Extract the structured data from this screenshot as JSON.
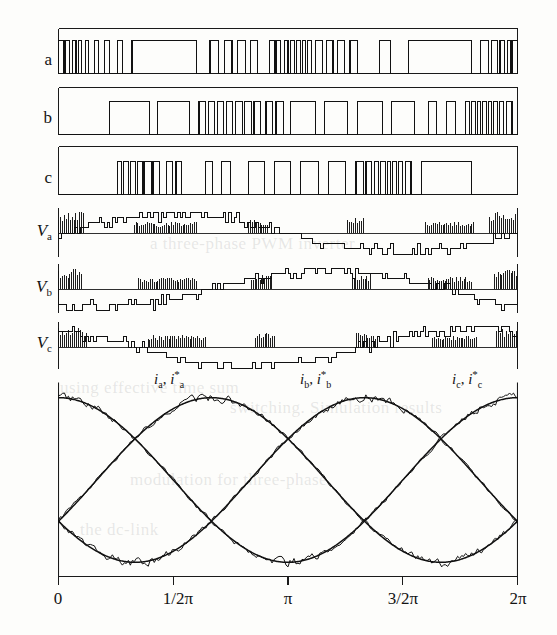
{
  "figure": {
    "background_color": "#fdfdfb",
    "line_color": "#111111",
    "axis_color": "#1a1a1a"
  },
  "axes": {
    "x_ticks": [
      {
        "label": "0",
        "value": 0
      },
      {
        "label": "1/2π",
        "value": 1.5707963
      },
      {
        "label": "π",
        "value": 3.1415927
      },
      {
        "label": "3/2π",
        "value": 4.712389
      },
      {
        "label": "2π",
        "value": 6.2831853
      }
    ],
    "x_range": [
      0,
      6.2831853
    ],
    "y_labels": [
      "a",
      "b",
      "c",
      "Va",
      "Vb",
      "Vc"
    ]
  },
  "row_labels": {
    "a": "a",
    "b": "b",
    "c": "c",
    "va_main": "V",
    "va_sub": "a",
    "vb_main": "V",
    "vb_sub": "b",
    "vc_main": "V",
    "vc_sub": "c"
  },
  "current_labels": [
    {
      "base": "i",
      "sub": "a",
      "star": "*",
      "sep": ", "
    },
    {
      "base": "i",
      "sub": "b",
      "star": "*",
      "sep": ", "
    },
    {
      "base": "i",
      "sub": "c",
      "star": "*",
      "sep": ", "
    }
  ],
  "bleed_text": [
    {
      "text": "a three-phase PWM inverter",
      "x": 150,
      "y": 234
    },
    {
      "text": "using effective time sum",
      "x": 60,
      "y": 378
    },
    {
      "text": "switching. Simulation results",
      "x": 230,
      "y": 398
    },
    {
      "text": "modulation for three-phase",
      "x": 130,
      "y": 470
    },
    {
      "text": "the dc-link",
      "x": 80,
      "y": 520
    }
  ],
  "chart_data": {
    "type": "line",
    "xlabel": "",
    "ylabel": "",
    "xlim": [
      0,
      6.2831853
    ],
    "x_tick_labels": [
      "0",
      "1/2π",
      "π",
      "3/2π",
      "2π"
    ],
    "x_tick_values": [
      0,
      1.5707963,
      3.1415927,
      4.712389,
      6.2831853
    ],
    "grid": false,
    "legend": "none",
    "panels": [
      {
        "name": "a",
        "kind": "switching_function",
        "ylim": [
          0,
          1
        ],
        "description": "Phase-a switching function: binary 0/1 PWM gating signal, one fundamental period",
        "comment": "pulse list: [start,end] normalized 0..1 of the x-span, value 1 (high) between entries",
        "pulses": [
          [
            0.0,
            0.012
          ],
          [
            0.016,
            0.024
          ],
          [
            0.03,
            0.038
          ],
          [
            0.044,
            0.05
          ],
          [
            0.058,
            0.066
          ],
          [
            0.078,
            0.088
          ],
          [
            0.1,
            0.112
          ],
          [
            0.128,
            0.14
          ],
          [
            0.16,
            0.3
          ],
          [
            0.33,
            0.348
          ],
          [
            0.362,
            0.378
          ],
          [
            0.39,
            0.408
          ],
          [
            0.418,
            0.434
          ],
          [
            0.46,
            0.47
          ],
          [
            0.474,
            0.484
          ],
          [
            0.492,
            0.5
          ],
          [
            0.506,
            0.514
          ],
          [
            0.518,
            0.527
          ],
          [
            0.531,
            0.539
          ],
          [
            0.543,
            0.551
          ],
          [
            0.56,
            0.575
          ],
          [
            0.584,
            0.598
          ],
          [
            0.608,
            0.624
          ],
          [
            0.635,
            0.652
          ],
          [
            0.7,
            0.724
          ],
          [
            0.762,
            0.9
          ],
          [
            0.92,
            0.936
          ],
          [
            0.944,
            0.956
          ],
          [
            0.962,
            0.972
          ],
          [
            0.978,
            0.986
          ],
          [
            0.99,
            1.0
          ]
        ]
      },
      {
        "name": "b",
        "kind": "switching_function",
        "ylim": [
          0,
          1
        ],
        "description": "Phase-b switching function: binary 0/1 PWM gating signal, 120 degrees shifted",
        "pulses": [
          [
            0.112,
            0.198
          ],
          [
            0.216,
            0.286
          ],
          [
            0.306,
            0.32
          ],
          [
            0.326,
            0.34
          ],
          [
            0.346,
            0.36
          ],
          [
            0.366,
            0.38
          ],
          [
            0.386,
            0.4
          ],
          [
            0.406,
            0.42
          ],
          [
            0.426,
            0.44
          ],
          [
            0.452,
            0.466
          ],
          [
            0.474,
            0.49
          ],
          [
            0.506,
            0.56
          ],
          [
            0.58,
            0.63
          ],
          [
            0.652,
            0.706
          ],
          [
            0.726,
            0.776
          ],
          [
            0.806,
            0.824
          ],
          [
            0.846,
            0.864
          ],
          [
            0.886,
            0.896
          ],
          [
            0.9,
            0.908
          ],
          [
            0.912,
            0.92
          ],
          [
            0.924,
            0.932
          ],
          [
            0.936,
            0.944
          ],
          [
            0.948,
            0.956
          ],
          [
            0.96,
            0.97
          ],
          [
            0.976,
            0.988
          ]
        ]
      },
      {
        "name": "c",
        "kind": "switching_function",
        "ylim": [
          0,
          1
        ],
        "description": "Phase-c switching function: binary 0/1 PWM gating signal, 240 degrees shifted",
        "pulses": [
          [
            0.128,
            0.138
          ],
          [
            0.142,
            0.152
          ],
          [
            0.156,
            0.168
          ],
          [
            0.172,
            0.184
          ],
          [
            0.188,
            0.202
          ],
          [
            0.206,
            0.22
          ],
          [
            0.236,
            0.248
          ],
          [
            0.256,
            0.268
          ],
          [
            0.32,
            0.336
          ],
          [
            0.356,
            0.374
          ],
          [
            0.414,
            0.448
          ],
          [
            0.47,
            0.506
          ],
          [
            0.528,
            0.566
          ],
          [
            0.588,
            0.626
          ],
          [
            0.648,
            0.664
          ],
          [
            0.67,
            0.682
          ],
          [
            0.688,
            0.698
          ],
          [
            0.702,
            0.712
          ],
          [
            0.716,
            0.724
          ],
          [
            0.728,
            0.736
          ],
          [
            0.74,
            0.75
          ],
          [
            0.756,
            0.768
          ],
          [
            0.79,
            0.9
          ]
        ]
      },
      {
        "name": "Va",
        "kind": "pole_voltage",
        "ylim": [
          -1,
          1
        ],
        "description": "Phase-a pole voltage: multilevel PWM stepped waveform with high-frequency chopping",
        "n_steps": 170
      },
      {
        "name": "Vb",
        "kind": "pole_voltage",
        "ylim": [
          -1,
          1
        ],
        "description": "Phase-b pole voltage: multilevel PWM stepped waveform, 120 degrees shifted",
        "n_steps": 170
      },
      {
        "name": "Vc",
        "kind": "pole_voltage",
        "ylim": [
          -1,
          1
        ],
        "description": "Phase-c pole voltage: multilevel PWM stepped waveform, 240 degrees shifted",
        "n_steps": 170
      },
      {
        "name": "currents",
        "kind": "currents",
        "ylim": [
          -1.15,
          1.15
        ],
        "description": "Three-phase load currents: measured (rippled) overlaid on sinusoidal references",
        "series": [
          {
            "name": "ia",
            "phase_deg": 0,
            "amplitude": 1.0,
            "style": "reference-sine"
          },
          {
            "name": "ia*",
            "phase_deg": 0,
            "amplitude": 1.0,
            "style": "measured-ripple"
          },
          {
            "name": "ib",
            "phase_deg": -120,
            "amplitude": 1.0,
            "style": "reference-sine"
          },
          {
            "name": "ib*",
            "phase_deg": -120,
            "amplitude": 1.0,
            "style": "measured-ripple"
          },
          {
            "name": "ic",
            "phase_deg": 120,
            "amplitude": 1.0,
            "style": "reference-sine"
          },
          {
            "name": "ic*",
            "phase_deg": 120,
            "amplitude": 1.0,
            "style": "measured-ripple"
          }
        ],
        "peak_positions_rad": [
          1.5707963,
          3.6651914,
          5.7595865
        ]
      }
    ]
  }
}
